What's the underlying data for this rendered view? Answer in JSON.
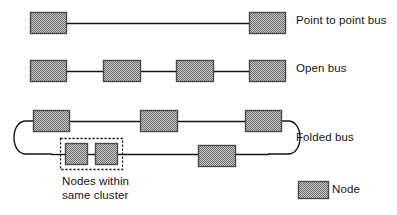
{
  "figure": {
    "background_color": "#ffffff",
    "line_color": "#141414",
    "node_fill_color": "#9a9a9a",
    "node_border_color": "#4a4a4a",
    "cluster_border_color": "#141414"
  },
  "rows": {
    "point_to_point": {
      "label": "Point to point bus",
      "node_count": 2,
      "nodes": [
        {
          "name": "node-ptp-1",
          "x": 30,
          "y": 12,
          "w": 36,
          "h": 21
        },
        {
          "name": "node-ptp-2",
          "x": 249,
          "y": 12,
          "w": 36,
          "h": 21
        }
      ],
      "links": [
        {
          "name": "link-ptp-1",
          "x1": 66,
          "y1": 23,
          "x2": 249,
          "y2": 23
        }
      ]
    },
    "open_bus": {
      "label": "Open bus",
      "node_count": 4,
      "nodes": [
        {
          "name": "node-open-1",
          "x": 30,
          "y": 60,
          "w": 36,
          "h": 21
        },
        {
          "name": "node-open-2",
          "x": 103,
          "y": 60,
          "w": 37,
          "h": 21
        },
        {
          "name": "node-open-3",
          "x": 176,
          "y": 60,
          "w": 37,
          "h": 21
        },
        {
          "name": "node-open-4",
          "x": 249,
          "y": 60,
          "w": 36,
          "h": 21
        }
      ],
      "links": [
        {
          "name": "link-open-1",
          "x1": 66,
          "y1": 71,
          "x2": 103,
          "y2": 71
        },
        {
          "name": "link-open-2",
          "x1": 140,
          "y1": 71,
          "x2": 176,
          "y2": 71
        },
        {
          "name": "link-open-3",
          "x1": 213,
          "y1": 71,
          "x2": 249,
          "y2": 71
        }
      ]
    },
    "folded_bus": {
      "label": "Folded bus",
      "node_count": 6,
      "top_nodes": [
        {
          "name": "node-folded-top-1",
          "x": 33,
          "y": 110,
          "w": 36,
          "h": 21
        },
        {
          "name": "node-folded-top-2",
          "x": 140,
          "y": 110,
          "w": 37,
          "h": 21
        },
        {
          "name": "node-folded-top-3",
          "x": 245,
          "y": 110,
          "w": 36,
          "h": 21
        }
      ],
      "bottom_nodes": [
        {
          "name": "node-cluster-a",
          "x": 65,
          "y": 143,
          "w": 22,
          "h": 21
        },
        {
          "name": "node-cluster-b",
          "x": 95,
          "y": 143,
          "w": 22,
          "h": 21
        },
        {
          "name": "node-folded-bottom-1",
          "x": 198,
          "y": 145,
          "w": 37,
          "h": 21
        }
      ],
      "top_links": [
        {
          "name": "link-folded-top-1",
          "x1": 69,
          "y1": 121,
          "x2": 140,
          "y2": 121
        },
        {
          "name": "link-folded-top-2",
          "x1": 177,
          "y1": 121,
          "x2": 245,
          "y2": 121
        }
      ],
      "bottom_links": [
        {
          "name": "link-folded-bottom-1",
          "x1": 52,
          "y1": 154,
          "x2": 65,
          "y2": 154
        },
        {
          "name": "link-folded-bottom-2",
          "x1": 87,
          "y1": 154,
          "x2": 95,
          "y2": 154
        },
        {
          "name": "link-folded-bottom-3",
          "x1": 117,
          "y1": 154,
          "x2": 198,
          "y2": 154
        },
        {
          "name": "link-folded-bottom-4",
          "x1": 235,
          "y1": 154,
          "x2": 268,
          "y2": 154
        }
      ],
      "fold_left": {
        "name": "fold-left-curve",
        "path": "M 33 121 L 26 121 C 10 121 10 154 26 154 L 52 154"
      },
      "fold_right": {
        "name": "fold-right-curve",
        "path": "M 281 121 L 288 121 C 304 121 304 154 288 154 L 268 154"
      },
      "cluster_box": {
        "name": "cluster-dashed-box",
        "x": 60,
        "y": 138,
        "w": 62,
        "h": 31
      }
    }
  },
  "captions": {
    "cluster": "Nodes within\nsame cluster"
  },
  "legend": {
    "swatch_name": "node-legend-swatch",
    "swatch": {
      "x": 298,
      "y": 181,
      "w": 30,
      "h": 17
    },
    "label": "Node"
  }
}
